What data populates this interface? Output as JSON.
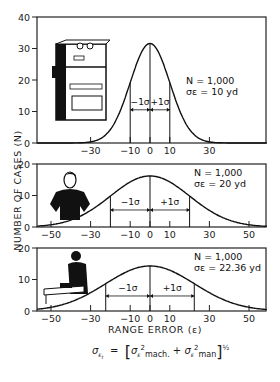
{
  "chart_data": {
    "type": "line",
    "ylabel": "NUMBER OF CASES (N)",
    "xlabel": "RANGE ERROR (ε)",
    "formula": "σεt = [σε²mach. + σε²man]^½",
    "panels": [
      {
        "name": "machine",
        "picture": "computer-cabinet",
        "ylim": [
          0,
          40
        ],
        "yticks": [
          0,
          10,
          20,
          30,
          40
        ],
        "xticks": [
          -30,
          -10,
          0,
          10,
          30
        ],
        "xlim": [
          -57,
          59
        ],
        "N": "1,000",
        "sigma": 10,
        "sigma_label": "10 yd",
        "peak": 31.6,
        "sigma_markers": [
          "-1σ",
          "+1σ"
        ],
        "annotation_N": "N  =  1,000",
        "annotation_sigma": "σε  =  10 yd"
      },
      {
        "name": "man",
        "picture": "standing-man",
        "ylim": [
          0,
          20
        ],
        "yticks": [
          0,
          10,
          20
        ],
        "xticks": [
          -50,
          -30,
          -10,
          0,
          10,
          30,
          50
        ],
        "xlim": [
          -57,
          59
        ],
        "N": "1,000",
        "sigma": 20,
        "sigma_label": "20 yd",
        "peak": 16.2,
        "sigma_markers": [
          "-1σ",
          "+1σ"
        ],
        "annotation_N": "N  =  1,000",
        "annotation_sigma": "σε  =  20 yd"
      },
      {
        "name": "man-machine",
        "picture": "man-at-console",
        "ylim": [
          0,
          20
        ],
        "yticks": [
          0,
          10,
          20
        ],
        "xticks": [
          -50,
          -30,
          -10,
          0,
          10,
          30,
          50
        ],
        "xlim": [
          -57,
          59
        ],
        "N": "1,000",
        "sigma": 22.36,
        "sigma_label": "22.36 yd",
        "peak": 14.3,
        "sigma_markers": [
          "-1σ",
          "+1σ"
        ],
        "annotation_N": "N  =  1,000",
        "annotation_sigma": "σε  =  22.36 yd"
      }
    ]
  },
  "labels": {
    "ylabel": "NUMBER OF CASES (N)",
    "xlabel": "RANGE ERROR (ε)"
  }
}
